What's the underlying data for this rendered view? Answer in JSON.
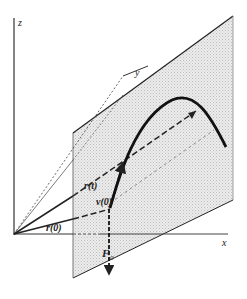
{
  "diagram": {
    "axes": {
      "z_label": "z",
      "y_label": "y",
      "x_label": "x"
    },
    "labels": {
      "r_t": "r(t)",
      "v_0": "v(0)",
      "r_0": "r(0)",
      "F_0_main": "F",
      "F_0_sub": "0"
    },
    "colors": {
      "plane_fill": "#d9d9d9",
      "line": "#222222"
    }
  }
}
